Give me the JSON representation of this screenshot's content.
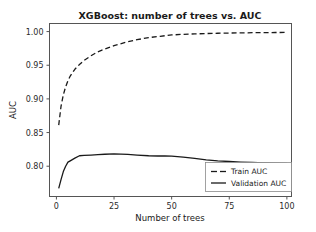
{
  "chart_data": {
    "type": "line",
    "title": "XGBoost: number of trees vs. AUC",
    "xlabel": "Number of trees",
    "ylabel": "AUC",
    "xlim": [
      -3,
      102
    ],
    "ylim": [
      0.755,
      1.012
    ],
    "grid": false,
    "legend_position": "lower right",
    "xticks": [
      0,
      25,
      50,
      75,
      100
    ],
    "xtick_labels": [
      "0",
      "25",
      "50",
      "75",
      "100"
    ],
    "yticks": [
      0.8,
      0.85,
      0.9,
      0.95,
      1.0
    ],
    "ytick_labels": [
      "0.80",
      "0.85",
      "0.90",
      "0.95",
      "1.00"
    ],
    "line_color": "#1a1a1a",
    "series": [
      {
        "name": "Train AUC",
        "style": "dashed",
        "x": [
          1,
          2,
          3,
          4,
          5,
          6,
          8,
          10,
          12,
          15,
          18,
          21,
          25,
          30,
          35,
          40,
          45,
          50,
          55,
          60,
          65,
          70,
          75,
          80,
          85,
          90,
          95,
          100
        ],
        "values": [
          0.861,
          0.889,
          0.906,
          0.918,
          0.927,
          0.934,
          0.944,
          0.951,
          0.957,
          0.964,
          0.97,
          0.974,
          0.979,
          0.984,
          0.988,
          0.991,
          0.993,
          0.995,
          0.9959,
          0.9966,
          0.9971,
          0.9975,
          0.9978,
          0.9981,
          0.9983,
          0.9985,
          0.9986,
          0.9987
        ]
      },
      {
        "name": "Validation AUC",
        "style": "solid",
        "x": [
          1,
          2,
          3,
          4,
          5,
          6,
          8,
          10,
          12,
          15,
          18,
          21,
          25,
          28,
          31,
          35,
          40,
          44,
          47,
          50,
          55,
          60,
          65,
          70,
          75,
          80,
          85,
          90,
          95,
          100
        ],
        "values": [
          0.767,
          0.78,
          0.792,
          0.8,
          0.806,
          0.808,
          0.812,
          0.8155,
          0.816,
          0.8165,
          0.8172,
          0.8178,
          0.8182,
          0.818,
          0.8175,
          0.8166,
          0.8155,
          0.8152,
          0.8154,
          0.815,
          0.8135,
          0.8115,
          0.8095,
          0.808,
          0.807,
          0.8062,
          0.8055,
          0.805,
          0.8046,
          0.8042
        ]
      }
    ],
    "legend_entries": [
      "Train AUC",
      "Validation AUC"
    ]
  }
}
